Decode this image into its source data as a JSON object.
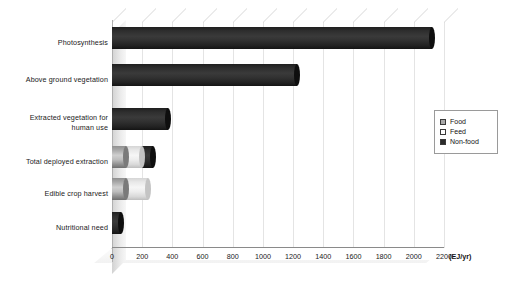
{
  "chart_data": {
    "type": "bar",
    "orientation": "horizontal",
    "stacked": true,
    "threeD": true,
    "title": "",
    "subtitle": "",
    "xlabel": "(EJ/yr)",
    "ylabel": "",
    "xlim": [
      0,
      2200
    ],
    "xticks": [
      0,
      200,
      400,
      600,
      800,
      1000,
      1200,
      1400,
      1600,
      1800,
      2000,
      2200
    ],
    "xtick_labels": [
      "0",
      "200",
      "400",
      "600",
      "800",
      "1000",
      "1200",
      "1400",
      "1600",
      "1800",
      "2000",
      "2200"
    ],
    "grid": true,
    "grid_axis": "x",
    "legend_position": "right",
    "categories": [
      "Photosynthesis",
      "Above ground vegetation",
      "Extracted vegetation for human use",
      "Total deployed extraction",
      "Edible crop harvest",
      "Nutritional need"
    ],
    "series": [
      {
        "name": "Food",
        "color": "#a9a9a9",
        "values": [
          0,
          0,
          0,
          90,
          90,
          0
        ]
      },
      {
        "name": "Feed",
        "color": "#ffffff",
        "values": [
          0,
          0,
          0,
          110,
          150,
          0
        ]
      },
      {
        "name": "Non-food",
        "color": "#2b2b2b",
        "values": [
          2120,
          1225,
          370,
          70,
          0,
          60
        ]
      }
    ],
    "totals": [
      2120,
      1225,
      370,
      270,
      240,
      60
    ],
    "units": "EJ/yr"
  },
  "legend": {
    "items": [
      {
        "label": "Food",
        "swatch": "food"
      },
      {
        "label": "Feed",
        "swatch": "feed"
      },
      {
        "label": "Non-food",
        "swatch": "nonfood"
      }
    ]
  },
  "axis": {
    "unit_label": "(EJ/yr)"
  },
  "categories_display": [
    {
      "lines": [
        "Photosynthesis"
      ]
    },
    {
      "lines": [
        "Above ground vegetation"
      ]
    },
    {
      "lines": [
        "Extracted vegetation for",
        "human use"
      ]
    },
    {
      "lines": [
        "Total deployed extraction"
      ]
    },
    {
      "lines": [
        "Edible crop harvest"
      ]
    },
    {
      "lines": [
        "Nutritional need"
      ]
    }
  ]
}
